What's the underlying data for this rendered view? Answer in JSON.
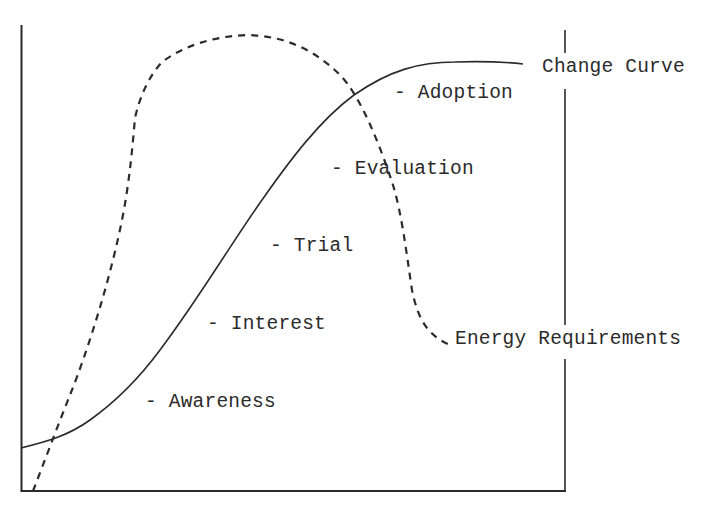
{
  "diagram": {
    "type": "curve-diagram",
    "curves": {
      "change_curve": {
        "label": "Change Curve",
        "style": "solid",
        "shape": "S-shaped (sigmoid) rising curve"
      },
      "energy_requirements": {
        "label": "Energy Requirements",
        "style": "dashed",
        "shape": "rises steeply, peaks early, then falls sharply"
      }
    },
    "stages": [
      {
        "label": "- Awareness"
      },
      {
        "label": "- Interest"
      },
      {
        "label": "- Trial"
      },
      {
        "label": "- Evaluation"
      },
      {
        "label": "- Adoption"
      }
    ],
    "colors": {
      "ink": "#2b2b2b",
      "background": "#ffffff"
    }
  }
}
